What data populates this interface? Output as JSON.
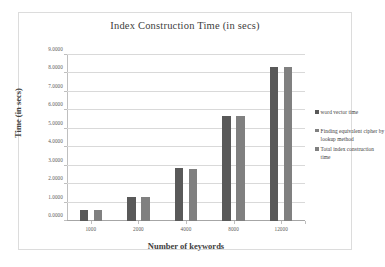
{
  "chart_data": {
    "type": "bar",
    "title": "Index Construction Time (in secs)",
    "xlabel": "Number of keywords",
    "ylabel": "Time (in secs)",
    "categories": [
      "1000",
      "2000",
      "4000",
      "8000",
      "12000"
    ],
    "ylim": [
      0,
      9
    ],
    "ytick_step": 1,
    "ytick_labels": [
      "0.0000",
      "1.0000",
      "2.0000",
      "3.0000",
      "4.0000",
      "5.0000",
      "6.0000",
      "7.0000",
      "8.0000",
      "9.0000"
    ],
    "grid": true,
    "legend_position": "right",
    "series": [
      {
        "name": "word vector time",
        "color": "#595959",
        "values": [
          0.62,
          1.3,
          2.85,
          5.7,
          8.33
        ]
      },
      {
        "name": "Finding equivalent cipher by lookup method",
        "color": "#808080",
        "values": [
          0.0,
          0.0,
          0.0,
          0.0,
          0.0
        ]
      },
      {
        "name": "Total index construction time",
        "color": "#808080",
        "values": [
          0.62,
          1.3,
          2.83,
          5.68,
          8.37
        ]
      }
    ],
    "plotted_series_indices": [
      0,
      2
    ],
    "annotations": []
  },
  "colors": {
    "series_dark": "#595959",
    "series_mid": "#808080",
    "gridline": "#d9d9d9",
    "axis": "#bfbfbf",
    "frame": "#dcdcdc",
    "text": "#404040",
    "tick_text": "#595959",
    "background": "#ffffff"
  }
}
